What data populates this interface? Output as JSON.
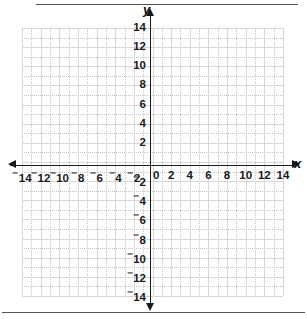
{
  "page": {
    "top_rule": "horizontal-rule",
    "bottom_rule": "horizontal-rule"
  },
  "axes": {
    "x_label": "x",
    "y_label": "y",
    "origin_label": "0",
    "x_arrow_left": "arrow-left",
    "x_arrow_right": "arrow-right",
    "y_arrow_up": "arrow-up",
    "y_arrow_down": "arrow-down"
  },
  "colors": {
    "axis": "#1a1a1a",
    "grid_major": "#d6d6dc",
    "grid_minor": "#c6c6cf",
    "background": "#ffffff",
    "rule": "#555555",
    "text": "#1a1a1a"
  },
  "ticks": {
    "x_negative": [
      "14",
      "12",
      "10",
      "8",
      "6",
      "4",
      "2"
    ],
    "x_positive": [
      "2",
      "4",
      "6",
      "8",
      "10",
      "12",
      "14"
    ],
    "y_positive": [
      "2",
      "4",
      "6",
      "8",
      "10",
      "12",
      "14"
    ],
    "y_negative": [
      "2",
      "4",
      "6",
      "8",
      "10",
      "12",
      "14"
    ],
    "negative_prefix": "⁻"
  },
  "chart_data": {
    "type": "scatter",
    "title": "",
    "subtitle": "",
    "xlabel": "x",
    "ylabel": "y",
    "xlim": [
      -14,
      14
    ],
    "ylim": [
      -14,
      14
    ],
    "xticks": [
      -14,
      -12,
      -10,
      -8,
      -6,
      -4,
      -2,
      0,
      2,
      4,
      6,
      8,
      10,
      12,
      14
    ],
    "yticks": [
      -14,
      -12,
      -10,
      -8,
      -6,
      -4,
      -2,
      0,
      2,
      4,
      6,
      8,
      10,
      12,
      14
    ],
    "xtick_labels": [
      "⁻14",
      "⁻12",
      "⁻10",
      "⁻8",
      "⁻6",
      "⁻4",
      "⁻2",
      "0",
      "2",
      "4",
      "6",
      "8",
      "10",
      "12",
      "14"
    ],
    "ytick_labels": [
      "⁻14",
      "⁻12",
      "⁻10",
      "⁻8",
      "⁻6",
      "⁻4",
      "⁻2",
      "0",
      "2",
      "4",
      "6",
      "8",
      "10",
      "12",
      "14"
    ],
    "major_tick_step": 2,
    "minor_tick_step": 1,
    "grid": true,
    "grid_major_step": 2,
    "grid_minor_step": 1,
    "legend": false,
    "legend_position": "none",
    "series": [],
    "annotations": []
  }
}
